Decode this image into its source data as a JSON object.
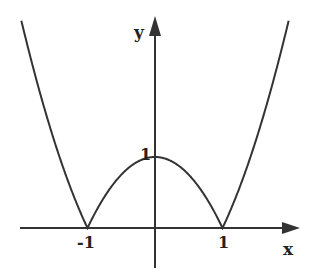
{
  "figure": {
    "function": "y = |x^2 - 1|",
    "axes": {
      "x_label": "x",
      "y_label": "y"
    },
    "tick_labels": {
      "x_neg1": "-1",
      "x_pos1": "1",
      "y_pos1": "1"
    },
    "key_points": [
      {
        "x": -1,
        "y": 0
      },
      {
        "x": 0,
        "y": 1
      },
      {
        "x": 1,
        "y": 0
      }
    ],
    "colors": {
      "curve": "#333333",
      "axes": "#333333",
      "background": "#ffffff"
    }
  }
}
